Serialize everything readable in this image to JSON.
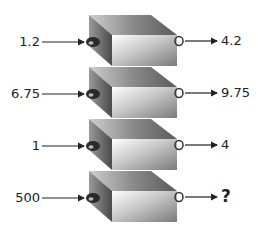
{
  "diagram": {
    "type": "function-machines",
    "machines": [
      {
        "input": "1.2",
        "output": "4.2"
      },
      {
        "input": "6.75",
        "output": "9.75"
      },
      {
        "input": "1",
        "output": "4"
      },
      {
        "input": "500",
        "output": "?"
      }
    ]
  }
}
